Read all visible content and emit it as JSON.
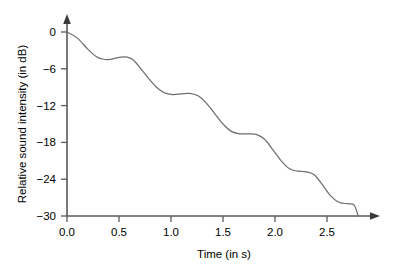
{
  "chart_data": {
    "type": "line",
    "title": "",
    "xlabel": "Time (in s)",
    "ylabel": "Relative sound intensity (in dB)",
    "xlim": [
      0.0,
      2.95
    ],
    "ylim": [
      -30,
      0
    ],
    "grid": false,
    "legend": null,
    "xticks": [
      "0.0",
      "0.5",
      "1.0",
      "1.5",
      "2.0",
      "2.5"
    ],
    "xtick_values": [
      0.0,
      0.5,
      1.0,
      1.5,
      2.0,
      2.5
    ],
    "yticks": [
      "0",
      "−6",
      "−12",
      "−18",
      "−24",
      "−30"
    ],
    "ytick_values": [
      0,
      -6,
      -12,
      -18,
      -24,
      -30
    ],
    "series": [
      {
        "name": "relative sound intensity",
        "x": [
          0.0,
          0.1,
          0.2,
          0.28,
          0.34,
          0.4,
          0.46,
          0.52,
          0.58,
          0.64,
          0.72,
          0.8,
          0.88,
          0.95,
          1.02,
          1.1,
          1.18,
          1.26,
          1.34,
          1.42,
          1.5,
          1.58,
          1.66,
          1.74,
          1.82,
          1.9,
          1.98,
          2.06,
          2.14,
          2.22,
          2.3,
          2.38,
          2.46,
          2.54,
          2.62,
          2.7,
          2.76,
          2.8
        ],
        "y": [
          0.0,
          -1.0,
          -2.8,
          -4.0,
          -4.4,
          -4.5,
          -4.3,
          -4.1,
          -4.1,
          -4.6,
          -6.2,
          -7.9,
          -9.3,
          -10.0,
          -10.2,
          -10.1,
          -10.0,
          -10.4,
          -11.6,
          -13.3,
          -15.0,
          -16.2,
          -16.6,
          -16.6,
          -16.7,
          -17.5,
          -19.2,
          -21.0,
          -22.3,
          -22.7,
          -22.8,
          -23.3,
          -25.0,
          -26.8,
          -27.8,
          -28.0,
          -28.2,
          -30.0
        ]
      }
    ],
    "annotations": []
  },
  "axes": {
    "x_axis_name": "time-axis",
    "y_axis_name": "intensity-axis",
    "x_arrow": "right-arrow",
    "y_arrow": "up-arrow"
  }
}
